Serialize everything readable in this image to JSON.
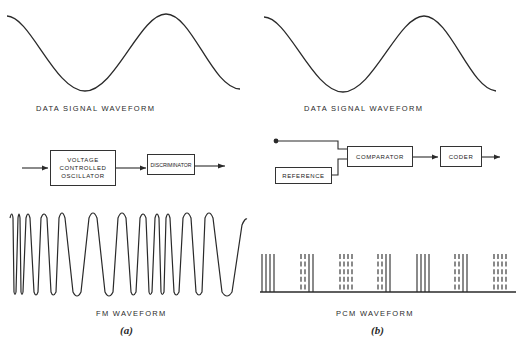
{
  "panel_a": {
    "data_signal_caption": "DATA SIGNAL WAVEFORM",
    "vco_block": {
      "line1": "VOLTAGE",
      "line2": "CONTROLLED",
      "line3": "OSCILLATOR"
    },
    "discriminator_block": "DISCRIMINATOR",
    "fm_caption": "FM  WAVEFORM",
    "label": "(a)"
  },
  "panel_b": {
    "data_signal_caption": "DATA SIGNAL  WAVEFORM",
    "reference_block": "REFERENCE",
    "comparator_block": "COMPARATOR",
    "coder_block": "CODER",
    "pcm_caption": "PCM   WAVEFORM",
    "label": "(b)",
    "pcm_groups": [
      [
        "S",
        "S",
        "S",
        "S"
      ],
      [
        "D",
        "D",
        "S",
        "S"
      ],
      [
        "D",
        "D",
        "D",
        "D"
      ],
      [
        "D",
        "D",
        "S",
        "S"
      ],
      [
        "S",
        "S",
        "S",
        "S"
      ],
      [
        "D",
        "D",
        "S",
        "S"
      ],
      [
        "D",
        "D",
        "D",
        "D"
      ]
    ]
  },
  "colors": {
    "ink": "#2a2a2a",
    "background": "#ffffff"
  }
}
